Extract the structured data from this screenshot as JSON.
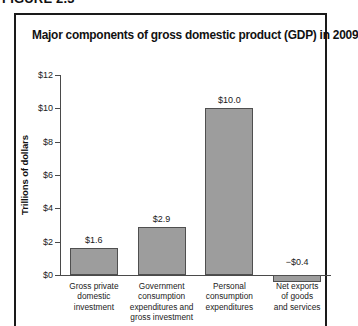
{
  "figure": {
    "caption": "FIGURE 2.3",
    "title": "Major components of gross domestic product (GDP) in 2009"
  },
  "chart_data": {
    "type": "bar",
    "title": "Major components of gross domestic product (GDP) in 2009",
    "xlabel": "",
    "ylabel": "Trillions of dollars",
    "ylim": [
      0,
      12
    ],
    "ytick_step": 2,
    "ytick_labels": [
      "$0",
      "$2",
      "$4",
      "$6",
      "$8",
      "$10",
      "$12"
    ],
    "ytick_values": [
      0,
      2,
      4,
      6,
      8,
      10,
      12
    ],
    "grid": false,
    "legend": "none",
    "bar_color": "#9d9d9d",
    "bar_edge_color": "#4f4f4f",
    "categories": [
      "Gross private\ndomestic\ninvestment",
      "Government\nconsumption\nexpenditures and\ngross investment",
      "Personal\nconsumption\nexpenditures",
      "Net exports\nof goods\nand services"
    ],
    "values": [
      1.6,
      2.9,
      10.0,
      -0.4
    ],
    "data_labels": [
      "$1.6",
      "$2.9",
      "$10.0",
      "−$0.4"
    ]
  }
}
